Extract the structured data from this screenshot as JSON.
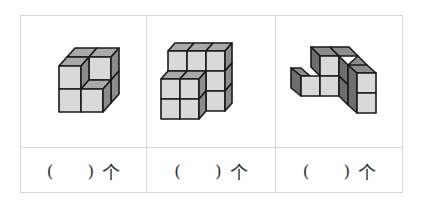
{
  "table": {
    "columns": [
      {
        "figure": "cube-stack-1",
        "answer_open": "(",
        "answer_close": ")",
        "unit": "个"
      },
      {
        "figure": "cube-stack-2",
        "answer_open": "(",
        "answer_close": ")",
        "unit": "个"
      },
      {
        "figure": "cube-stack-3",
        "answer_open": "(",
        "answer_close": ")",
        "unit": "个"
      }
    ]
  },
  "colors": {
    "front": "#d9d9d9",
    "top": "#a9a9a9",
    "side": "#8c8c8c",
    "dark_side": "#6e6e6e",
    "edge": "#1a1a1a",
    "border": "#d6d6d6"
  }
}
